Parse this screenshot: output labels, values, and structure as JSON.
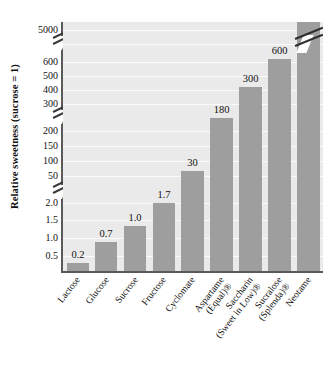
{
  "chart_data": {
    "type": "bar",
    "title": "",
    "xlabel": "",
    "ylabel": "Relative sweetness (sucrose = 1)",
    "grid": true,
    "legend": "none",
    "axis_note": "broken y-axis with three breaks; last bar (7000) is truncated with a break mark",
    "y_tick_labels": [
      "5000",
      "600",
      "500",
      "400",
      "300",
      "200",
      "150",
      "100",
      "50",
      "2.0",
      "1.5",
      "1.0",
      "0.5"
    ],
    "y_breaks": [
      {
        "between": [
          "5000",
          "600"
        ]
      },
      {
        "between": [
          "300",
          "200"
        ]
      },
      {
        "between": [
          "50",
          "2.0"
        ]
      }
    ],
    "categories": [
      "Lactose",
      "Glucose",
      "Sucrose",
      "Fructose",
      "Cyclomate",
      "Aspartame",
      "Saccharin",
      "Sucralose",
      "Neotame"
    ],
    "category_sublabels": [
      "",
      "",
      "",
      "",
      "",
      "(Equal)®",
      "(Sweet in Low)®",
      "(Splenda)®",
      ""
    ],
    "values": [
      0.2,
      0.7,
      1.0,
      1.7,
      30,
      180,
      300,
      600,
      7000
    ],
    "value_labels": [
      "0.2",
      "0.7",
      "1.0",
      "1.7",
      "30",
      "180",
      "300",
      "600",
      "7000"
    ],
    "colors": {
      "bar": "#9e9e9e",
      "plot_background": "#eaeaea",
      "gridline": "#fbfbfb",
      "axis": "#5a5a5a",
      "text": "#111111"
    }
  },
  "layout": {
    "y_tick_positions": [
      {
        "label": "5000",
        "y": 30
      },
      {
        "label": "600",
        "y": 62
      },
      {
        "label": "500",
        "y": 76
      },
      {
        "label": "400",
        "y": 90
      },
      {
        "label": "300",
        "y": 104
      },
      {
        "label": "200",
        "y": 131
      },
      {
        "label": "150",
        "y": 146
      },
      {
        "label": "100",
        "y": 161
      },
      {
        "label": "50",
        "y": 176
      },
      {
        "label": "2.0",
        "y": 203
      },
      {
        "label": "1.5",
        "y": 220
      },
      {
        "label": "1.0",
        "y": 238
      },
      {
        "label": "0.5",
        "y": 256
      }
    ],
    "gridline_y": [
      8,
      22,
      40,
      54,
      68,
      82,
      109,
      124,
      139,
      154,
      181,
      198,
      216,
      234
    ],
    "bar_geometry": [
      {
        "left": 4,
        "width": 22,
        "height": 8,
        "label_y": -14
      },
      {
        "left": 32,
        "width": 22,
        "height": 29,
        "label_y": -14
      },
      {
        "left": 61,
        "width": 22,
        "height": 45,
        "label_y": -14
      },
      {
        "left": 90,
        "width": 22,
        "height": 68,
        "label_y": -14
      },
      {
        "left": 118,
        "width": 23,
        "height": 100,
        "label_y": -14
      },
      {
        "left": 147,
        "width": 23,
        "height": 153,
        "label_y": -14
      },
      {
        "left": 176,
        "width": 23,
        "height": 184,
        "label_y": -14
      },
      {
        "left": 205,
        "width": 23,
        "height": 212,
        "label_y": -14
      },
      {
        "left": 234,
        "width": 23,
        "height": 249,
        "label_y": -14
      }
    ],
    "cat_label_anchor_x": [
      74,
      103,
      132,
      160,
      189,
      218,
      247,
      276,
      305
    ]
  }
}
